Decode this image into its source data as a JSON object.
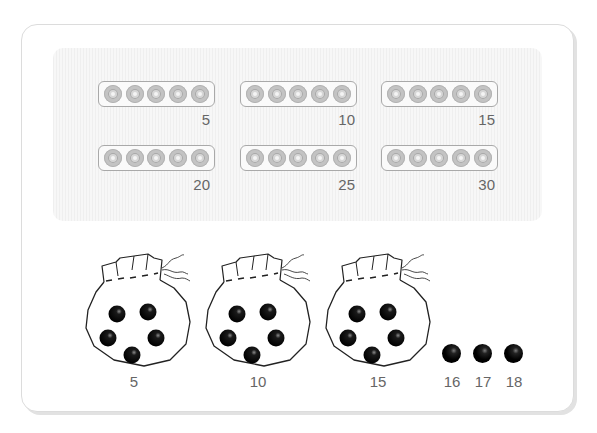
{
  "strips": [
    {
      "beads": 5,
      "label": "5"
    },
    {
      "beads": 5,
      "label": "10"
    },
    {
      "beads": 5,
      "label": "15"
    },
    {
      "beads": 5,
      "label": "20"
    },
    {
      "beads": 5,
      "label": "25"
    },
    {
      "beads": 5,
      "label": "30"
    }
  ],
  "bags": [
    {
      "beads": 5,
      "label": "5"
    },
    {
      "beads": 5,
      "label": "10"
    },
    {
      "beads": 5,
      "label": "15"
    }
  ],
  "loose_beads": [
    {
      "label": "16"
    },
    {
      "label": "17"
    },
    {
      "label": "18"
    }
  ],
  "colors": {
    "card_border": "#dcdcdc",
    "strip_border": "#a9a9a9",
    "bead_gray": "#c3c3c3",
    "bead_black": "#000000",
    "label_text": "#666666"
  }
}
